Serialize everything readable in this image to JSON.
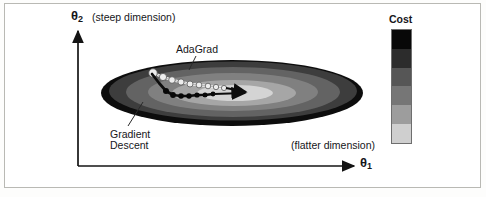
{
  "figure": {
    "background": "#ffffff",
    "frame_color": "#b9b9b4",
    "axis_color": "#1a1a1a"
  },
  "axes": {
    "y": {
      "symbol": "θ",
      "subscript": "2",
      "note": "(steep dimension)"
    },
    "x": {
      "symbol": "θ",
      "subscript": "1",
      "note": "(flatter dimension)"
    }
  },
  "annotations": [
    {
      "name": "adagrad",
      "text": "AdaGrad"
    },
    {
      "name": "gradient-descent",
      "line1": "Gradient",
      "line2": "Descent"
    }
  ],
  "legend": {
    "title": "Cost",
    "bands": [
      {
        "label": "highest",
        "color": "#080808"
      },
      {
        "label": "high",
        "color": "#2c2c2c"
      },
      {
        "label": "mid-high",
        "color": "#565656"
      },
      {
        "label": "mid",
        "color": "#767676"
      },
      {
        "label": "mid-low",
        "color": "#9d9d9d"
      },
      {
        "label": "low",
        "color": "#cfcfcf"
      }
    ]
  },
  "chart_data": {
    "type": "contour",
    "title": "",
    "xlabel": "θ1 (flatter dimension)",
    "ylabel": "θ2 (steep dimension)",
    "grid": false,
    "legend_position": "right",
    "legend_title": "Cost",
    "contour_center": {
      "x": 232,
      "y": 93
    },
    "contours": [
      {
        "level": 6,
        "label": "highest",
        "rx": 131,
        "ry": 33,
        "color": "#0d0d0d"
      },
      {
        "level": 5,
        "label": "high",
        "rx": 124,
        "ry": 30,
        "color": "#3a3a3a"
      },
      {
        "level": 4,
        "label": "mid-high",
        "rx": 107,
        "ry": 25,
        "color": "#616161"
      },
      {
        "level": 3,
        "label": "mid",
        "rx": 85,
        "ry": 19,
        "color": "#7e7e7e"
      },
      {
        "level": 2,
        "label": "mid-low",
        "rx": 62,
        "ry": 13,
        "color": "#a5a5a5"
      },
      {
        "level": 1,
        "label": "low",
        "rx": 38,
        "ry": 8,
        "color": "#d3d3d3"
      }
    ],
    "ylim": [
      0,
      1
    ],
    "xlim": [
      0,
      1
    ],
    "series": [
      {
        "name": "AdaGrad",
        "style": "light-dotted-path",
        "marker_color": "#ededed",
        "marker_edge": "#5a5a5a",
        "start": {
          "x": 153,
          "y": 73
        },
        "points": [
          {
            "x": 153,
            "y": 73
          },
          {
            "x": 163,
            "y": 77
          },
          {
            "x": 172,
            "y": 80
          },
          {
            "x": 181,
            "y": 82
          },
          {
            "x": 190,
            "y": 84
          },
          {
            "x": 199,
            "y": 85
          },
          {
            "x": 208,
            "y": 86
          },
          {
            "x": 216,
            "y": 87
          },
          {
            "x": 224,
            "y": 88
          }
        ],
        "arrow_to": {
          "x": 244,
          "y": 92
        }
      },
      {
        "name": "Gradient Descent",
        "style": "dark-dotted-zigzag",
        "marker_color": "#101010",
        "marker_edge": "#000000",
        "start": {
          "x": 153,
          "y": 73
        },
        "points": [
          {
            "x": 153,
            "y": 73
          },
          {
            "x": 160,
            "y": 82
          },
          {
            "x": 166,
            "y": 90
          },
          {
            "x": 173,
            "y": 95
          },
          {
            "x": 181,
            "y": 96
          },
          {
            "x": 189,
            "y": 96
          },
          {
            "x": 197,
            "y": 95
          },
          {
            "x": 205,
            "y": 95
          },
          {
            "x": 213,
            "y": 94
          }
        ],
        "arrow_to": {
          "x": 243,
          "y": 93
        }
      }
    ]
  }
}
